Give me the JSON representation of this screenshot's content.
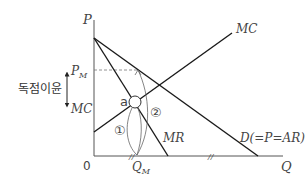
{
  "diagram": {
    "title": "",
    "axes": {
      "y_label": "P",
      "x_label": "Q",
      "origin_label": "0"
    },
    "curves": {
      "mc_label": "MC",
      "mr_label": "MR",
      "demand_label": "D(=P=AR)"
    },
    "price_labels": {
      "pm": "P",
      "pm_sub": "M",
      "mc_level": "MC"
    },
    "quantity_labels": {
      "qm": "Q",
      "qm_sub": "M"
    },
    "annotations": {
      "monopoly_profit": "독점이윤",
      "point_a": "a",
      "circle_1": "①",
      "circle_2": "②",
      "tick_mark": "//"
    },
    "colors": {
      "line": "#1a1a1a",
      "axis": "#555555",
      "dashed": "#777777",
      "arc": "#666666"
    }
  }
}
